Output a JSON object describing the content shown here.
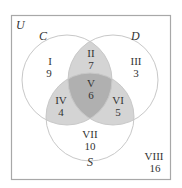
{
  "diagram": {
    "type": "venn-3",
    "universe_label": "U",
    "sets": [
      {
        "name": "C"
      },
      {
        "name": "D"
      },
      {
        "name": "S"
      }
    ],
    "regions": [
      {
        "id": "I",
        "numeral": "I",
        "count": "9",
        "description": "C only"
      },
      {
        "id": "II",
        "numeral": "II",
        "count": "7",
        "description": "C and D, not S"
      },
      {
        "id": "III",
        "numeral": "III",
        "count": "3",
        "description": "D only"
      },
      {
        "id": "IV",
        "numeral": "IV",
        "count": "4",
        "description": "C and S, not D"
      },
      {
        "id": "V",
        "numeral": "V",
        "count": "6",
        "description": "C, D and S"
      },
      {
        "id": "VI",
        "numeral": "VI",
        "count": "5",
        "description": "D and S, not C"
      },
      {
        "id": "VII",
        "numeral": "VII",
        "count": "10",
        "description": "S only"
      },
      {
        "id": "VIII",
        "numeral": "VIII",
        "count": "16",
        "description": "outside C, D, S"
      }
    ],
    "colors": {
      "border": "#a8a8a8",
      "circle": "#c8c8c8",
      "pair_overlap": "#d4d4d4",
      "triple_overlap": "#b0b0b0",
      "text": "#333333"
    }
  }
}
